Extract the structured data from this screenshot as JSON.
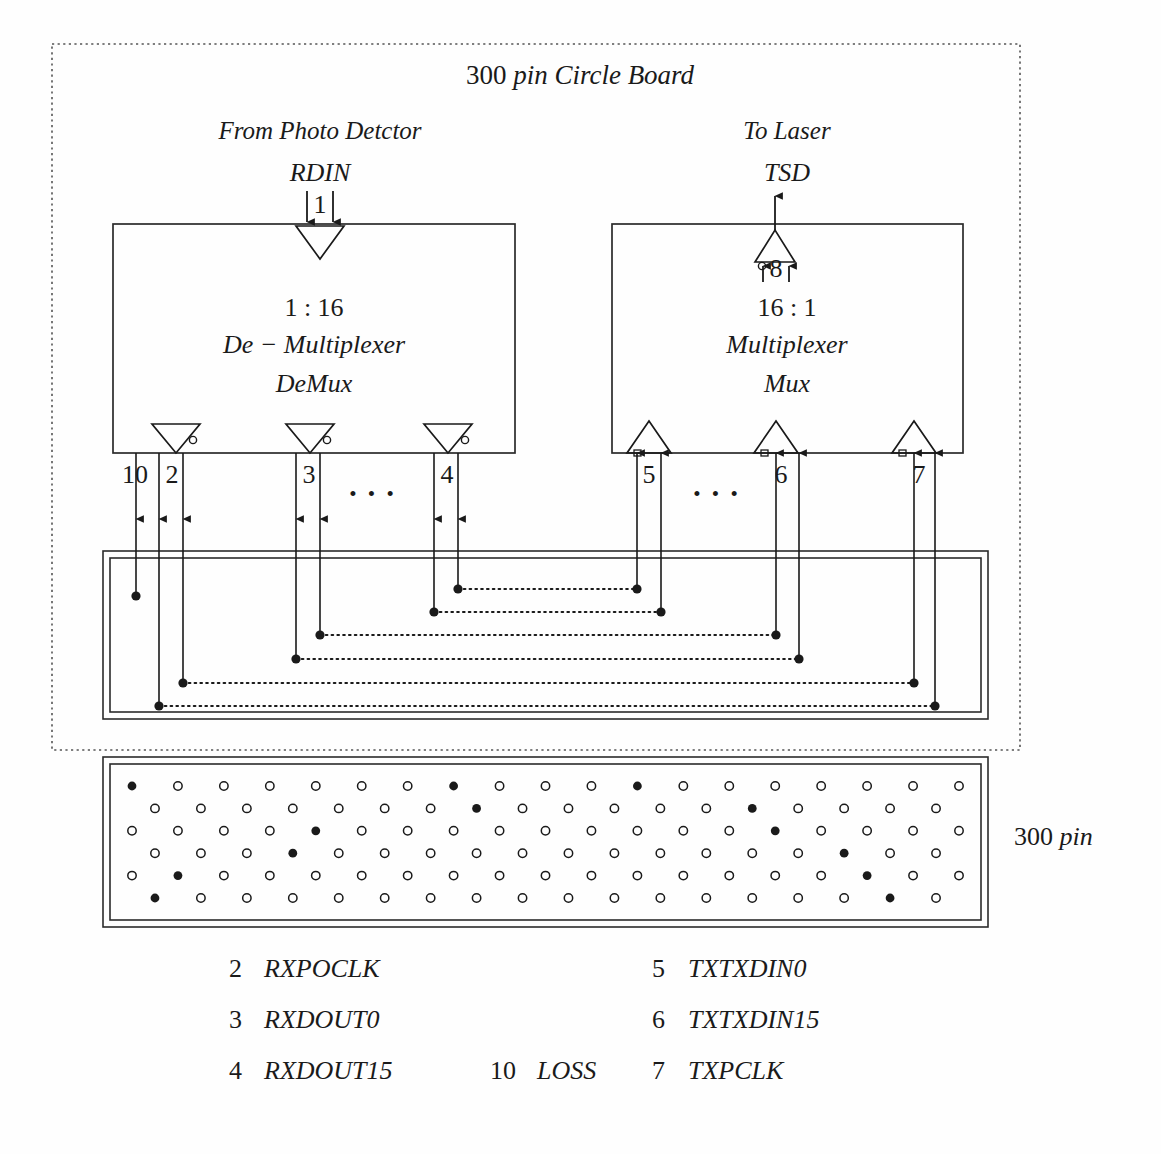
{
  "diagram": {
    "title": "300 pin Circle Board",
    "title_parts": {
      "num": "300 ",
      "word": "pin",
      "rest": " Circle Board"
    },
    "outer_pin_label": {
      "num": "300 ",
      "word": "pin"
    },
    "left_source_label": "From Photo Detctor",
    "left_signal_label": "RDIN",
    "left_bus_width": "1",
    "right_sink_label": "To Laser",
    "right_signal_label": "TSD",
    "right_bus_width": "8",
    "demux": {
      "ratio": "1 : 16",
      "name": "De − Multiplexer",
      "abbr": "DeMux",
      "port_labels": [
        "10",
        "2",
        "3",
        "4"
      ],
      "ellipsis": "• • •"
    },
    "mux": {
      "ratio": "16 : 1",
      "name": "Multiplexer",
      "abbr": "Mux",
      "port_labels": [
        "5",
        "6",
        "7"
      ],
      "ellipsis": "• • •"
    },
    "legend": {
      "column_left": [
        {
          "num": "2",
          "name": "RXPOCLK"
        },
        {
          "num": "3",
          "name": "RXDOUT0"
        },
        {
          "num": "4",
          "name": "RXDOUT15"
        }
      ],
      "column_mid": [
        {
          "num": "10",
          "name": "LOSS"
        }
      ],
      "column_right": [
        {
          "num": "5",
          "name": "TXTXDIN0"
        },
        {
          "num": "6",
          "name": "TXTXDIN15"
        },
        {
          "num": "7",
          "name": "TXPCLK"
        }
      ]
    },
    "colors": {
      "ink": "#1a1a1a",
      "line": "#2b2b2b",
      "paper": "#fefefe"
    },
    "pin_grid": {
      "rows": 6,
      "cols_odd": 19,
      "cols_even": 18,
      "filled_pins": [
        [
          0,
          0
        ],
        [
          0,
          7
        ],
        [
          0,
          11
        ],
        [
          1,
          7
        ],
        [
          1,
          13
        ],
        [
          2,
          4
        ],
        [
          2,
          14
        ],
        [
          3,
          3
        ],
        [
          3,
          15
        ],
        [
          4,
          1
        ],
        [
          4,
          16
        ],
        [
          5,
          0
        ],
        [
          5,
          16
        ]
      ]
    }
  }
}
